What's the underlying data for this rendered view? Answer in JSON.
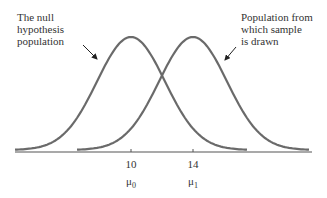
{
  "annotations": {
    "left": [
      "The null",
      "hypothesis",
      "population"
    ],
    "right": [
      "Population from",
      "which sample",
      "is drawn"
    ]
  },
  "axis": {
    "ticks": [
      {
        "value": "10",
        "symbol": "μ",
        "subscript": "0"
      },
      {
        "value": "14",
        "symbol": "μ",
        "subscript": "1"
      }
    ]
  },
  "colors": {
    "curve": "#6a6a6a",
    "axis": "#555555",
    "text": "#333333"
  }
}
